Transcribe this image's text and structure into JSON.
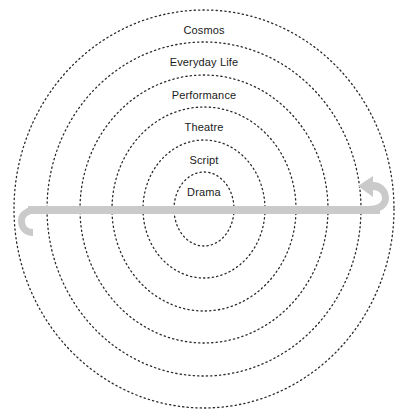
{
  "figure": {
    "background_color": "#ffffff",
    "ring_stroke_color": "#2b2b2b",
    "ring_style": "dotted",
    "label_color": "#1a1a1a",
    "arrow_color": "#c9c9c9"
  },
  "rings": [
    {
      "label": "Cosmos",
      "level": 1,
      "cx": 204,
      "cy": 209,
      "rx": 190,
      "ry": 199,
      "label_x": 204,
      "label_y": 30
    },
    {
      "label": "Everyday Life",
      "level": 2,
      "cx": 204,
      "cy": 209,
      "rx": 157,
      "ry": 167,
      "label_x": 204,
      "label_y": 62
    },
    {
      "label": "Performance",
      "level": 3,
      "cx": 204,
      "cy": 209,
      "rx": 124,
      "ry": 134,
      "label_x": 204,
      "label_y": 95
    },
    {
      "label": "Theatre",
      "level": 4,
      "cx": 204,
      "cy": 209,
      "rx": 92,
      "ry": 102,
      "label_x": 204,
      "label_y": 127
    },
    {
      "label": "Script",
      "level": 5,
      "cx": 204,
      "cy": 209,
      "rx": 61,
      "ry": 69,
      "label_x": 204,
      "label_y": 160
    },
    {
      "label": "Drama",
      "level": 6,
      "cx": 204,
      "cy": 209,
      "rx": 30,
      "ry": 37,
      "label_x": 204,
      "label_y": 192
    }
  ],
  "arrow": {
    "name": "bidirectional-hooked-arrow",
    "color": "#c9c9c9",
    "shaft_y": 210,
    "shaft_thickness": 8,
    "left_end_x": 28,
    "right_end_x": 380,
    "left_head": "hook-down",
    "right_head": "hook-up"
  }
}
